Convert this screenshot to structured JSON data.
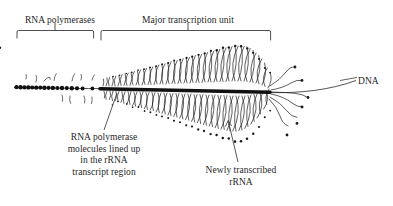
{
  "figure": {
    "background_color": "#ffffff",
    "ink_color": "#1a1a1a",
    "width": 393,
    "height": 206
  },
  "labels": {
    "rna_polymerases": "RNA polymerases",
    "major_transcription_unit": "Major transcription unit",
    "dna": "DNA",
    "polymerase_molecules": "RNA polymerase\nmolecules lined up\nin the rRNA\ntranscript region",
    "newly_transcribed": "Newly transcribed\nrRNA"
  },
  "diagram_data": {
    "type": "micrograph-tracing",
    "subject": "rRNA gene transcription (Miller chromatin spread)",
    "axis": {
      "label": "DNA",
      "y_center": 88,
      "x_start": 14,
      "x_end": 290,
      "description": "thin DNA fiber running horizontally, continuing to the right past the transcription unit"
    },
    "regions": [
      {
        "name": "spacer region with scattered RNA polymerases",
        "bracket_label": "RNA polymerases",
        "x_start": 16,
        "x_end": 92,
        "polymerase_count": 22,
        "fibril_length": "none to very short"
      },
      {
        "name": "major transcription unit",
        "bracket_label": "Major transcription unit",
        "x_start": 100,
        "x_end": 270,
        "polymerase_count": 96,
        "fibril_length": "short at left, increasing to long at right"
      }
    ],
    "brackets": [
      {
        "label": "RNA polymerases",
        "x_start": 16,
        "x_end": 94,
        "y": 30,
        "stem_x": 55
      },
      {
        "label": "Major transcription unit",
        "x_start": 100,
        "x_end": 271,
        "y": 30,
        "stem_x": 188
      }
    ],
    "leader_lines": [
      {
        "label": "RNA polymerase molecules lined up in the rRNA transcript region",
        "from_x": 104,
        "from_y": 130,
        "to_x": 117,
        "to_y": 92,
        "arrowhead": false
      },
      {
        "label": "Newly transcribed rRNA",
        "from_x": 238,
        "from_y": 163,
        "to_x": 228,
        "to_y": 120,
        "arrowhead": true
      },
      {
        "label": "DNA",
        "from_x": 356,
        "from_y": 80,
        "to_x": 288,
        "to_y": 93,
        "arrowhead": false
      }
    ]
  }
}
